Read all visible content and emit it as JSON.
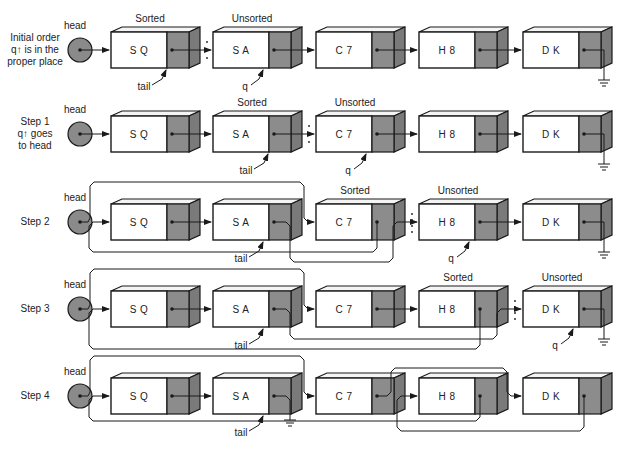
{
  "colors": {
    "ink": "#1a1a1a",
    "node_pointer": "#8c8c8c",
    "node_side": "#7a7a7a",
    "node_top": "#f4f4f4",
    "head_fill": "#8a8a8a",
    "background": "#ffffff"
  },
  "labels": {
    "head": "head",
    "tail": "tail",
    "q": "q",
    "sorted": "Sorted",
    "unsorted": "Unsorted"
  },
  "rows": [
    {
      "id": "initial",
      "caption": [
        "Initial order",
        "q↑ is in the",
        "proper place"
      ],
      "y": 32,
      "nodes": [
        "S Q",
        "S A",
        "C 7",
        "H 8",
        "D K"
      ],
      "sorted_over": 0,
      "unsorted_over": 1,
      "tail_at": 0,
      "q_at": 1,
      "divider_after": 0
    },
    {
      "id": "step1",
      "caption": [
        "Step 1",
        "q↑ goes",
        "to head"
      ],
      "y": 116,
      "nodes": [
        "S Q",
        "S A",
        "C 7",
        "H 8",
        "D K"
      ],
      "sorted_over": 1,
      "unsorted_over": 2,
      "tail_at": 1,
      "q_at": 2,
      "divider_after": 1
    },
    {
      "id": "step2",
      "caption": [
        "Step 2"
      ],
      "y": 204,
      "nodes": [
        "S Q",
        "S A",
        "C 7",
        "H 8",
        "D K"
      ],
      "sorted_over": 2,
      "unsorted_over": 3,
      "tail_at": 1,
      "q_at": 3,
      "divider_after": 2
    },
    {
      "id": "step3",
      "caption": [
        "Step 3"
      ],
      "y": 291,
      "nodes": [
        "S Q",
        "S A",
        "C 7",
        "H 8",
        "D K"
      ],
      "sorted_over": 3,
      "unsorted_over": 4,
      "tail_at": 1,
      "q_at": 4,
      "divider_after": 3
    },
    {
      "id": "step4",
      "caption": [
        "Step 4"
      ],
      "y": 378,
      "nodes": [
        "S Q",
        "S A",
        "C 7",
        "H 8",
        "D K"
      ],
      "sorted_over": null,
      "unsorted_over": null,
      "tail_at": 1,
      "q_at": null,
      "divider_after": null
    }
  ]
}
